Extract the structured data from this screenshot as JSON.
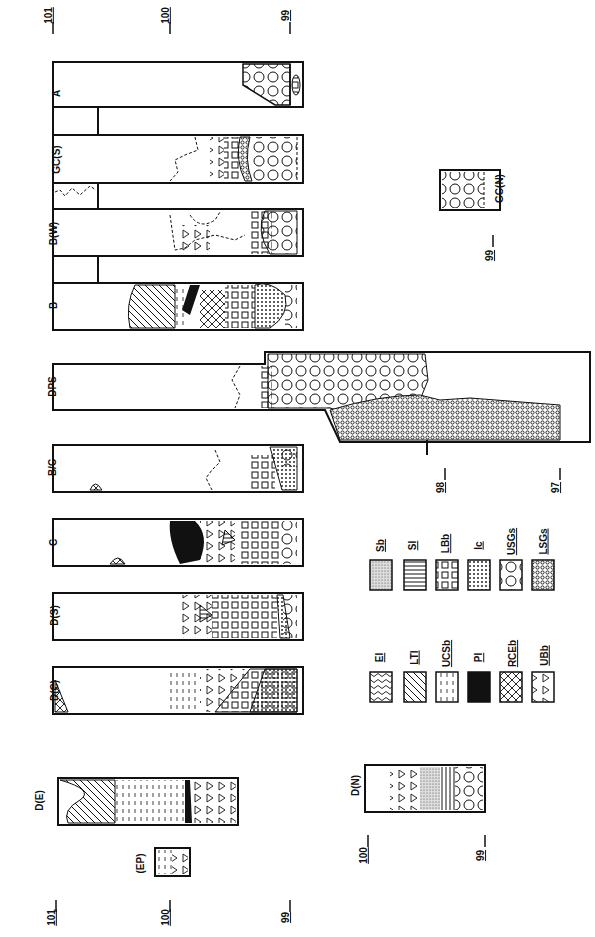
{
  "figure": {
    "orientation": "rotated-90-ccw",
    "sections": [
      {
        "id": "A",
        "label": "A"
      },
      {
        "id": "GCS",
        "label": "GC(S)"
      },
      {
        "id": "BW",
        "label": "B(W)"
      },
      {
        "id": "B",
        "label": "B"
      },
      {
        "id": "DPS",
        "label": "DPS"
      },
      {
        "id": "BC",
        "label": "B/C"
      },
      {
        "id": "C",
        "label": "C"
      },
      {
        "id": "DS",
        "label": "D(S)"
      },
      {
        "id": "DC",
        "label": "D(C)"
      },
      {
        "id": "DE",
        "label": "D(E)"
      },
      {
        "id": "EP",
        "label": "(EP)"
      },
      {
        "id": "DN",
        "label": "D(N)"
      },
      {
        "id": "GCN",
        "label": "GC(N)"
      }
    ],
    "depth_ticks_top": [
      "101",
      "100",
      "99"
    ],
    "depth_ticks_dps": [
      "98",
      "97"
    ],
    "depth_ticks_bottom": [
      "101",
      "100",
      "99"
    ],
    "depth_ticks_dn": [
      "100",
      "99"
    ],
    "depth_ticks_gcn": [
      "99"
    ],
    "legend": {
      "row1": [
        {
          "code": "Sb",
          "pattern": "stipple"
        },
        {
          "code": "Sl",
          "pattern": "horizontal-lines"
        },
        {
          "code": "LBb",
          "pattern": "large-squares"
        },
        {
          "code": "Ic",
          "pattern": "dots"
        },
        {
          "code": "USGs",
          "pattern": "large-circles"
        },
        {
          "code": "LSGs",
          "pattern": "small-circles-dense"
        }
      ],
      "row2": [
        {
          "code": "El",
          "pattern": "wavy-lines"
        },
        {
          "code": "LTl",
          "pattern": "diagonal-lines"
        },
        {
          "code": "UCSb",
          "pattern": "dashes"
        },
        {
          "code": "Pl",
          "pattern": "solid-black"
        },
        {
          "code": "RCEb",
          "pattern": "crosshatch"
        },
        {
          "code": "UBb",
          "pattern": "triangles"
        }
      ]
    }
  }
}
